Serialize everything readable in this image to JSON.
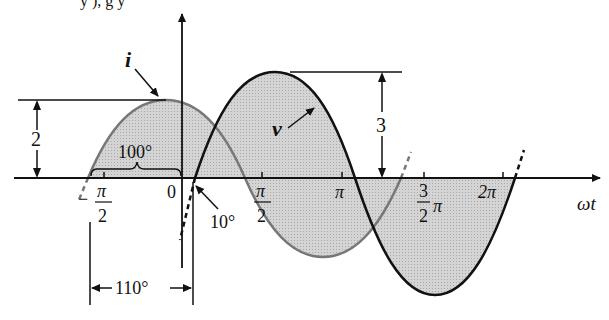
{
  "header_fragment": "y        ),     g        y",
  "diagram": {
    "curves": [
      {
        "name": "i",
        "amplitude": 2,
        "stroke": "#777777",
        "style": "gray"
      },
      {
        "name": "v",
        "amplitude": 3,
        "stroke": "#111111",
        "style": "black"
      }
    ],
    "labels": {
      "i": "i",
      "v": "v",
      "amp_i": "2",
      "amp_v": "3",
      "phase_i": "100°",
      "phase_v": "10°",
      "phase_diff": "110°",
      "axis": "ωt"
    },
    "ticks": {
      "neg_half_pi_num": "π",
      "neg_half_pi_den": "2",
      "neg_sign": "−",
      "zero": "0",
      "half_pi_num": "π",
      "half_pi_den": "2",
      "pi": "π",
      "three_half_num": "3",
      "three_half_den": "2",
      "three_half_pi": "π",
      "two_pi": "2π"
    },
    "colors": {
      "fill": "#c8c8c8",
      "axis": "#111111"
    }
  }
}
